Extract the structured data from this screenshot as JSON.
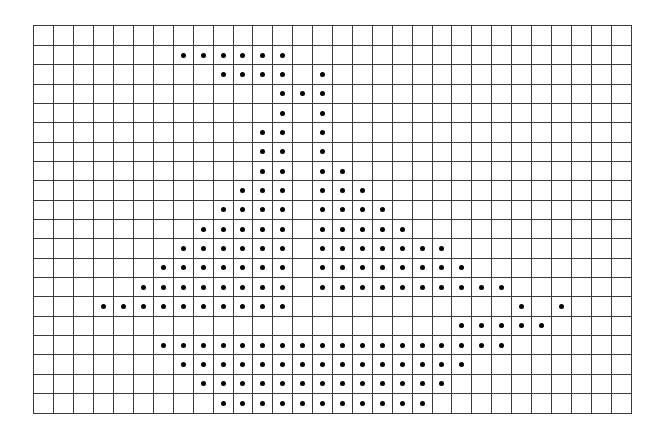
{
  "figure": {
    "description": "Dot pattern on square grid paper (sailboat-like shape)",
    "grid": {
      "columns": 30,
      "rows": 20,
      "line_color": "#3a3a3a",
      "background_color": "#ffffff"
    },
    "dot_color": "#000000",
    "dot_rows": [
      {
        "row": 0,
        "cols": []
      },
      {
        "row": 1,
        "cols": [
          7,
          8,
          9,
          10,
          11,
          12
        ]
      },
      {
        "row": 2,
        "cols": [
          9,
          10,
          11,
          12,
          14
        ]
      },
      {
        "row": 3,
        "cols": [
          12,
          13,
          14
        ]
      },
      {
        "row": 4,
        "cols": [
          12,
          14
        ]
      },
      {
        "row": 5,
        "cols": [
          11,
          12,
          14
        ]
      },
      {
        "row": 6,
        "cols": [
          11,
          12,
          14
        ]
      },
      {
        "row": 7,
        "cols": [
          11,
          12,
          14,
          15
        ]
      },
      {
        "row": 8,
        "cols": [
          10,
          11,
          12,
          14,
          15,
          16
        ]
      },
      {
        "row": 9,
        "cols": [
          9,
          10,
          11,
          12,
          14,
          15,
          16,
          17
        ]
      },
      {
        "row": 10,
        "cols": [
          8,
          9,
          10,
          11,
          12,
          14,
          15,
          16,
          17,
          18
        ]
      },
      {
        "row": 11,
        "cols": [
          7,
          8,
          9,
          10,
          11,
          12,
          14,
          15,
          16,
          17,
          18,
          19,
          20
        ]
      },
      {
        "row": 12,
        "cols": [
          6,
          7,
          8,
          9,
          10,
          11,
          12,
          14,
          15,
          16,
          17,
          18,
          19,
          20,
          21
        ]
      },
      {
        "row": 13,
        "cols": [
          5,
          6,
          7,
          8,
          9,
          10,
          11,
          12,
          14,
          15,
          16,
          17,
          18,
          19,
          20,
          21,
          22,
          23
        ]
      },
      {
        "row": 14,
        "cols": [
          3,
          4,
          5,
          6,
          7,
          8,
          9,
          10,
          11,
          12,
          24,
          26
        ]
      },
      {
        "row": 15,
        "cols": [
          21,
          22,
          23,
          24,
          25
        ]
      },
      {
        "row": 16,
        "cols": [
          6,
          7,
          8,
          9,
          10,
          11,
          12,
          13,
          14,
          15,
          16,
          17,
          18,
          19,
          20,
          21,
          22,
          23
        ]
      },
      {
        "row": 17,
        "cols": [
          7,
          8,
          9,
          10,
          11,
          12,
          13,
          14,
          15,
          16,
          17,
          18,
          19,
          20,
          21
        ]
      },
      {
        "row": 18,
        "cols": [
          8,
          9,
          10,
          11,
          12,
          13,
          14,
          15,
          16,
          17,
          18,
          19,
          20
        ]
      },
      {
        "row": 19,
        "cols": [
          9,
          10,
          11,
          12,
          13,
          14,
          15,
          16,
          17,
          18,
          19
        ]
      }
    ]
  }
}
